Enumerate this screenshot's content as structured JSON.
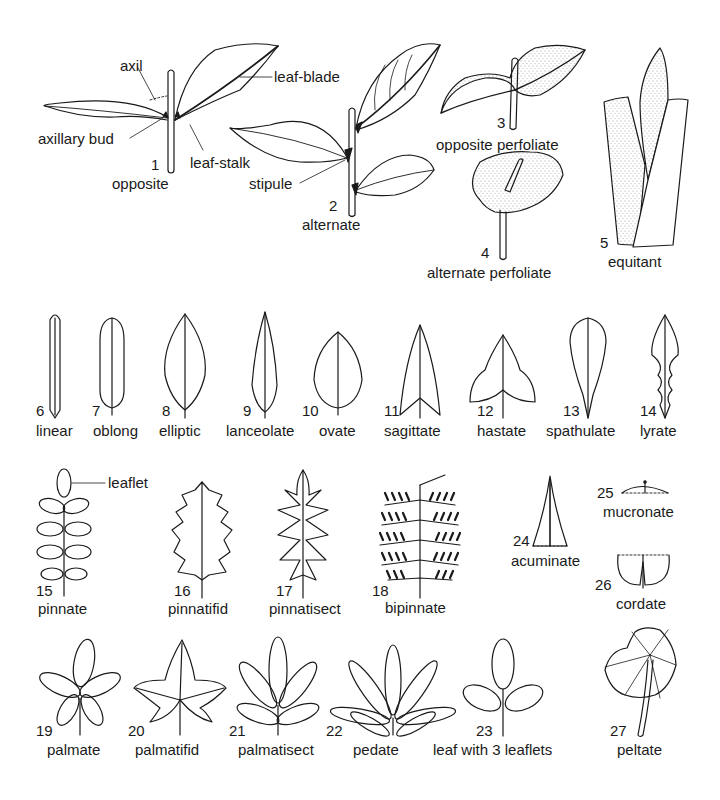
{
  "figure": {
    "parts": {
      "axil": "axil",
      "leaf_blade": "leaf-blade",
      "axillary_bud": "axillary bud",
      "leaf_stalk": "leaf-stalk",
      "stipule": "stipule",
      "leaflet": "leaflet"
    },
    "items": [
      {
        "n": "1",
        "label": "opposite"
      },
      {
        "n": "2",
        "label": "alternate"
      },
      {
        "n": "3",
        "label": "opposite perfoliate"
      },
      {
        "n": "4",
        "label": "alternate perfoliate"
      },
      {
        "n": "5",
        "label": "equitant"
      },
      {
        "n": "6",
        "label": "linear"
      },
      {
        "n": "7",
        "label": "oblong"
      },
      {
        "n": "8",
        "label": "elliptic"
      },
      {
        "n": "9",
        "label": "lanceolate"
      },
      {
        "n": "10",
        "label": "ovate"
      },
      {
        "n": "11",
        "label": "sagittate"
      },
      {
        "n": "12",
        "label": "hastate"
      },
      {
        "n": "13",
        "label": "spathulate"
      },
      {
        "n": "14",
        "label": "lyrate"
      },
      {
        "n": "15",
        "label": "pinnate"
      },
      {
        "n": "16",
        "label": "pinnatifid"
      },
      {
        "n": "17",
        "label": "pinnatisect"
      },
      {
        "n": "18",
        "label": "bipinnate"
      },
      {
        "n": "19",
        "label": "palmate"
      },
      {
        "n": "20",
        "label": "palmatifid"
      },
      {
        "n": "21",
        "label": "palmatisect"
      },
      {
        "n": "22",
        "label": "pedate"
      },
      {
        "n": "23",
        "label": "leaf with 3 leaflets"
      },
      {
        "n": "24",
        "label": "acuminate"
      },
      {
        "n": "25",
        "label": "mucronate"
      },
      {
        "n": "26",
        "label": "cordate"
      },
      {
        "n": "27",
        "label": "peltate"
      }
    ]
  }
}
